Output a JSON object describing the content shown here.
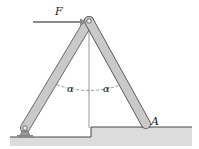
{
  "figure": {
    "type": "mechanics-diagram",
    "labels": {
      "force": "F",
      "angle_left": "α",
      "angle_right": "α",
      "point_a": "A"
    },
    "colors": {
      "bar_fill": "#c9c9c9",
      "bar_edge": "#555555",
      "ground_fill": "#d9d9d9",
      "force_arrow": "#8a8a8a",
      "line": "#444444"
    },
    "geometry": {
      "top_pin": [
        89,
        21
      ],
      "left_bar_end": [
        25,
        128
      ],
      "right_bar_end": [
        146,
        124
      ],
      "ground_low_y": 137,
      "ground_high_y": 127,
      "step_x": 91
    }
  }
}
